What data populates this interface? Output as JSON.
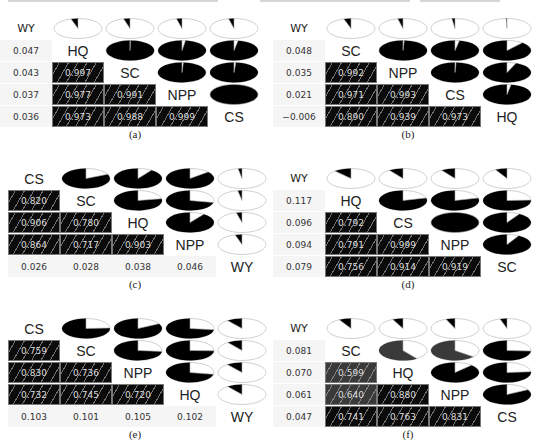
{
  "chart_data": [
    {
      "type": "heatmap",
      "title": "(a)",
      "variables_diagonal": [
        "HQ",
        "SC",
        "NPP",
        "CS"
      ],
      "corner_label": "WY",
      "wy_correlations": [
        0.047,
        0.043,
        0.037,
        0.036
      ],
      "lower_triangle": [
        [
          0.997
        ],
        [
          0.977,
          0.991
        ],
        [
          0.973,
          0.988,
          0.999
        ]
      ],
      "layout": "wy_left"
    },
    {
      "type": "heatmap",
      "title": "(b)",
      "variables_diagonal": [
        "SC",
        "NPP",
        "CS",
        "HQ"
      ],
      "corner_label": "WY",
      "wy_correlations": [
        0.048,
        0.035,
        0.021,
        -0.006
      ],
      "lower_triangle": [
        [
          0.992
        ],
        [
          0.971,
          0.993
        ],
        [
          0.89,
          0.939,
          0.973
        ]
      ],
      "layout": "wy_left"
    },
    {
      "type": "heatmap",
      "title": "(c)",
      "variables_diagonal": [
        "CS",
        "SC",
        "HQ",
        "NPP"
      ],
      "corner_label": "WY",
      "wy_correlations": [
        0.026,
        0.028,
        0.038,
        0.046
      ],
      "lower_triangle": [
        [
          0.82
        ],
        [
          0.906,
          0.78
        ],
        [
          0.864,
          0.717,
          0.903
        ]
      ],
      "layout": "wy_bottom"
    },
    {
      "type": "heatmap",
      "title": "(d)",
      "variables_diagonal": [
        "HQ",
        "CS",
        "NPP",
        "SC"
      ],
      "corner_label": "WY",
      "wy_correlations": [
        0.117,
        0.096,
        0.094,
        0.079
      ],
      "lower_triangle": [
        [
          0.792
        ],
        [
          0.791,
          0.999
        ],
        [
          0.756,
          0.914,
          0.919
        ]
      ],
      "layout": "wy_left"
    },
    {
      "type": "heatmap",
      "title": "(e)",
      "variables_diagonal": [
        "CS",
        "SC",
        "NPP",
        "HQ"
      ],
      "corner_label": "WY",
      "wy_correlations": [
        0.103,
        0.101,
        0.105,
        0.102
      ],
      "lower_triangle": [
        [
          0.759
        ],
        [
          0.83,
          0.736
        ],
        [
          0.732,
          0.745,
          0.72
        ]
      ],
      "layout": "wy_bottom"
    },
    {
      "type": "heatmap",
      "title": "(f)",
      "variables_diagonal": [
        "SC",
        "HQ",
        "NPP",
        "CS"
      ],
      "corner_label": "WY",
      "wy_correlations": [
        0.081,
        0.07,
        0.061,
        0.047
      ],
      "lower_triangle": [
        [
          0.599
        ],
        [
          0.64,
          0.88
        ],
        [
          0.741,
          0.763,
          0.831
        ]
      ],
      "layout": "wy_left"
    }
  ],
  "panels": [
    {
      "caption": "(a)",
      "corner": "WY",
      "diag": [
        "HQ",
        "SC",
        "NPP",
        "CS"
      ],
      "wy": [
        "0.047",
        "0.043",
        "0.037",
        "0.036"
      ],
      "tiles": [
        [
          "0.997"
        ],
        [
          "0.977",
          "0.991"
        ],
        [
          "0.973",
          "0.988",
          "0.999"
        ]
      ]
    },
    {
      "caption": "(b)",
      "corner": "WY",
      "diag": [
        "SC",
        "NPP",
        "CS",
        "HQ"
      ],
      "wy": [
        "0.048",
        "0.035",
        "0.021",
        "−0.006"
      ],
      "tiles": [
        [
          "0.992"
        ],
        [
          "0.971",
          "0.993"
        ],
        [
          "0.890",
          "0.939",
          "0.973"
        ]
      ]
    },
    {
      "caption": "(c)",
      "corner": "WY",
      "diag": [
        "CS",
        "SC",
        "HQ",
        "NPP"
      ],
      "wy": [
        "0.026",
        "0.028",
        "0.038",
        "0.046"
      ],
      "tiles": [
        [
          "0.820"
        ],
        [
          "0.906",
          "0.780"
        ],
        [
          "0.864",
          "0.717",
          "0.903"
        ]
      ]
    },
    {
      "caption": "(d)",
      "corner": "WY",
      "diag": [
        "HQ",
        "CS",
        "NPP",
        "SC"
      ],
      "wy": [
        "0.117",
        "0.096",
        "0.094",
        "0.079"
      ],
      "tiles": [
        [
          "0.792"
        ],
        [
          "0.791",
          "0.999"
        ],
        [
          "0.756",
          "0.914",
          "0.919"
        ]
      ]
    },
    {
      "caption": "(e)",
      "corner": "WY",
      "diag": [
        "CS",
        "SC",
        "NPP",
        "HQ"
      ],
      "wy": [
        "0.103",
        "0.101",
        "0.105",
        "0.102"
      ],
      "tiles": [
        [
          "0.759"
        ],
        [
          "0.830",
          "0.736"
        ],
        [
          "0.732",
          "0.745",
          "0.720"
        ]
      ]
    },
    {
      "caption": "(f)",
      "corner": "WY",
      "diag": [
        "SC",
        "HQ",
        "NPP",
        "CS"
      ],
      "wy": [
        "0.081",
        "0.070",
        "0.061",
        "0.047"
      ],
      "tiles": [
        [
          "0.599"
        ],
        [
          "0.640",
          "0.880"
        ],
        [
          "0.741",
          "0.763",
          "0.831"
        ]
      ]
    }
  ]
}
